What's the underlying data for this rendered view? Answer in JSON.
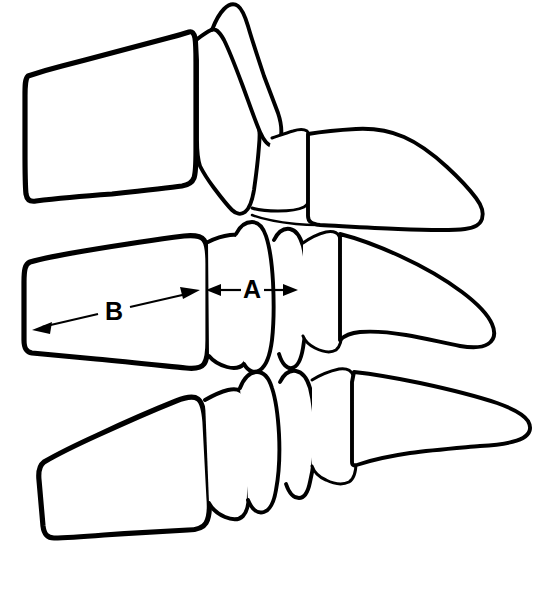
{
  "figure": {
    "background_color": "#ffffff",
    "line_color": "#000000",
    "width": 538,
    "height": 605,
    "view": "lateral (sagittal) line drawing"
  },
  "measurements": [
    {
      "id": "A",
      "label": "A",
      "description": "Sagittal diameter of the spinal canal",
      "label_x": 252,
      "label_y": 289,
      "arrow": {
        "x1": 206,
        "y1": 290,
        "x2": 298,
        "y2": 290,
        "double_headed": true,
        "orientation": "horizontal"
      }
    },
    {
      "id": "B",
      "label": "B",
      "description": "Sagittal diameter of the vertebral body",
      "label_x": 114,
      "label_y": 311,
      "arrow": {
        "x1": 33,
        "y1": 329,
        "x2": 199,
        "y2": 291,
        "double_headed": true,
        "orientation": "oblique"
      }
    }
  ],
  "vertebrae": [
    {
      "name": "upper-vertebra",
      "position": "top",
      "parts": [
        "vertebral-body",
        "pedicle",
        "articular-process",
        "spinous-process"
      ]
    },
    {
      "name": "middle-vertebra",
      "position": "middle",
      "parts": [
        "vertebral-body",
        "pedicle",
        "articular-process",
        "spinous-process"
      ]
    },
    {
      "name": "lower-vertebra",
      "position": "bottom",
      "parts": [
        "vertebral-body",
        "pedicle",
        "articular-process",
        "spinous-process"
      ]
    }
  ]
}
